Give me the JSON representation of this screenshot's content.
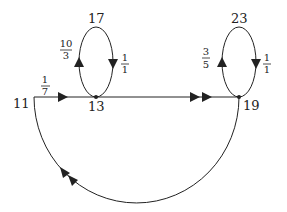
{
  "diagram": {
    "type": "directed-graph",
    "stroke_color": "#222222",
    "background": "#ffffff",
    "nodes": [
      {
        "id": "11",
        "label": "11"
      },
      {
        "id": "13",
        "label": "13"
      },
      {
        "id": "17",
        "label": "17"
      },
      {
        "id": "19",
        "label": "19"
      },
      {
        "id": "23",
        "label": "23"
      }
    ],
    "edges": [
      {
        "id": "e-11-13",
        "from": "11",
        "to": "13",
        "weight_num": "1",
        "weight_den": "7",
        "arrows": 1
      },
      {
        "id": "e-13-17",
        "from": "13",
        "to": "17",
        "weight_num": "10",
        "weight_den": "3",
        "arrows": 1
      },
      {
        "id": "e-17-13",
        "from": "17",
        "to": "13",
        "weight_num": "1",
        "weight_den": "1",
        "arrows": 1
      },
      {
        "id": "e-13-19",
        "from": "13",
        "to": "19",
        "weight_num": "",
        "weight_den": "",
        "arrows": 2
      },
      {
        "id": "e-19-23",
        "from": "19",
        "to": "23",
        "weight_num": "3",
        "weight_den": "5",
        "arrows": 1
      },
      {
        "id": "e-23-19",
        "from": "23",
        "to": "19",
        "weight_num": "1",
        "weight_den": "1",
        "arrows": 1
      },
      {
        "id": "e-19-11",
        "from": "19",
        "to": "11",
        "weight_num": "",
        "weight_den": "",
        "arrows": 2
      }
    ]
  }
}
